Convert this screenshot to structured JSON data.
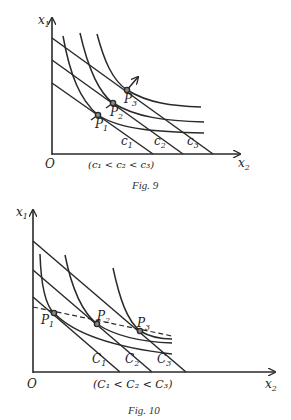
{
  "figures": [
    {
      "caption": "Fig. 9",
      "axes": {
        "y_label": "x",
        "y_sub": "1",
        "x_label": "x",
        "x_sub": "2",
        "origin": "O"
      },
      "points": [
        {
          "label": "P",
          "sub": "1"
        },
        {
          "label": "P",
          "sub": "2"
        },
        {
          "label": "P",
          "sub": "3"
        }
      ],
      "lines": [
        {
          "label": "c",
          "sub": "1"
        },
        {
          "label": "c",
          "sub": "2"
        },
        {
          "label": "c",
          "sub": "3"
        }
      ],
      "condition": "(c₁ < c₂ < c₃)"
    },
    {
      "caption": "Fig. 10",
      "axes": {
        "y_label": "x",
        "y_sub": "1",
        "x_label": "x",
        "x_sub": "2",
        "origin": "O"
      },
      "points": [
        {
          "label": "P",
          "sub": "1"
        },
        {
          "label": "P",
          "sub": "2"
        },
        {
          "label": "P",
          "sub": "3"
        }
      ],
      "lines": [
        {
          "label": "C",
          "sub": "1"
        },
        {
          "label": "C",
          "sub": "2"
        },
        {
          "label": "C",
          "sub": "3"
        }
      ],
      "condition": "(C₁ < C₂ < C₃)"
    }
  ]
}
